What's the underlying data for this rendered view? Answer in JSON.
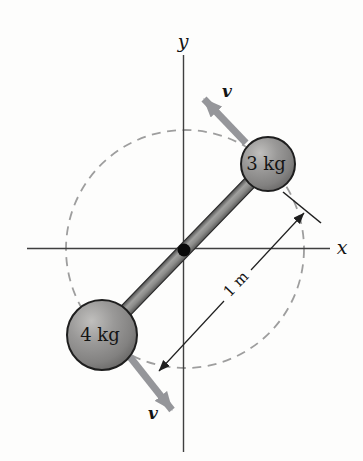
{
  "figure": {
    "axis_labels": {
      "x": "x",
      "y": "y"
    },
    "masses": [
      {
        "label": "3 kg"
      },
      {
        "label": "4 kg"
      }
    ],
    "velocity_top_label": "v",
    "velocity_bottom_label": "v",
    "dimension_label": "1 m",
    "colors": {
      "velocity_arrow": "#95969a",
      "dashed_circle": "#9e9e9e",
      "axis": "#3f3f3f",
      "dimension": "#1f1f1f",
      "text": "#141414",
      "ball_outline": "#1e1e1e",
      "rod_outline": "#2b2b2b",
      "dot": "#0a0a0a"
    }
  }
}
